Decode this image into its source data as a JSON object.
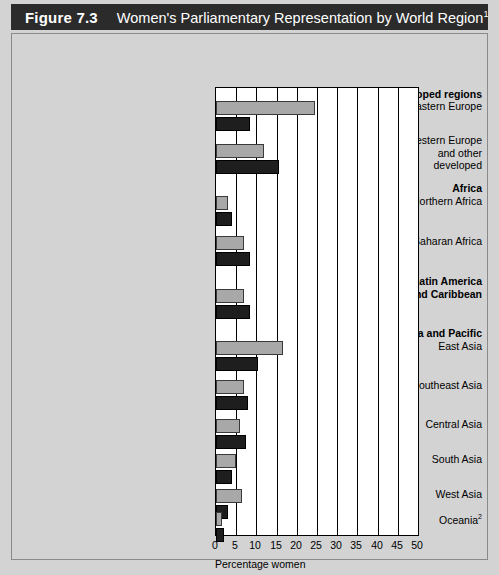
{
  "figure": {
    "number": "Figure 7.3",
    "title": "Women's Parliamentary Representation by World Region",
    "title_superscript": "1"
  },
  "legend": {
    "position": "bottom-left",
    "items": [
      {
        "label": "1987",
        "color": "#a8a8a8",
        "swatch": "legend-swatch-1987"
      },
      {
        "label": "1994",
        "color": "#1e1e1e",
        "swatch": "legend-swatch-1994"
      }
    ]
  },
  "axis": {
    "xlabel": "Percentage women",
    "ticks": [
      "0",
      "5",
      "10",
      "15",
      "20",
      "25",
      "30",
      "35",
      "40",
      "45",
      "50"
    ]
  },
  "rows": [
    {
      "kind": "group",
      "label": "Developed regions"
    },
    {
      "kind": "category",
      "label": "Eastern Europe",
      "v1987": 24.5,
      "v1994": 8.5
    },
    {
      "kind": "category",
      "label": "Western Europe\nand other\ndeveloped",
      "v1987": 12.0,
      "v1994": 15.5
    },
    {
      "kind": "group",
      "label": "Africa"
    },
    {
      "kind": "category",
      "label": "Northern Africa",
      "v1987": 3.0,
      "v1994": 4.0
    },
    {
      "kind": "category",
      "label": "Sub-Saharan Africa",
      "v1987": 7.0,
      "v1994": 8.5
    },
    {
      "kind": "group",
      "label": "Latin America\nand Caribbean"
    },
    {
      "kind": "category",
      "label": "",
      "v1987": 7.0,
      "v1994": 8.5
    },
    {
      "kind": "group",
      "label": "Asia and Pacific"
    },
    {
      "kind": "category",
      "label": "East Asia",
      "v1987": 16.5,
      "v1994": 10.5
    },
    {
      "kind": "category",
      "label": "Southeast Asia",
      "v1987": 7.0,
      "v1994": 8.0
    },
    {
      "kind": "category",
      "label": "Central Asia",
      "v1987": 6.0,
      "v1994": 7.5
    },
    {
      "kind": "category",
      "label": "South Asia",
      "v1987": 5.0,
      "v1994": 4.0
    },
    {
      "kind": "category",
      "label": "West Asia",
      "v1987": 6.5,
      "v1994": 3.0
    },
    {
      "kind": "category",
      "label": "Oceania",
      "label_superscript": "2",
      "v1987": 1.5,
      "v1994": 2.0
    }
  ],
  "chart_data": {
    "type": "bar",
    "orientation": "horizontal",
    "title": "Women's Parliamentary Representation by World Region",
    "xlabel": "Percentage women",
    "ylabel": "",
    "xlim": [
      0,
      50
    ],
    "xticks": [
      0,
      5,
      10,
      15,
      20,
      25,
      30,
      35,
      40,
      45,
      50
    ],
    "grid": true,
    "legend_position": "bottom-left",
    "categories": [
      "Eastern Europe",
      "Western Europe and other developed",
      "Northern Africa",
      "Sub-Saharan Africa",
      "Latin America and Caribbean",
      "East Asia",
      "Southeast Asia",
      "Central Asia",
      "South Asia",
      "West Asia",
      "Oceania"
    ],
    "group_headings": [
      {
        "label": "Developed regions",
        "categories": [
          "Eastern Europe",
          "Western Europe and other developed"
        ]
      },
      {
        "label": "Africa",
        "categories": [
          "Northern Africa",
          "Sub-Saharan Africa"
        ]
      },
      {
        "label": "Latin America and Caribbean",
        "categories": [
          "Latin America and Caribbean"
        ]
      },
      {
        "label": "Asia and Pacific",
        "categories": [
          "East Asia",
          "Southeast Asia",
          "Central Asia",
          "South Asia",
          "West Asia",
          "Oceania"
        ]
      }
    ],
    "series": [
      {
        "name": "1987",
        "color": "#a8a8a8",
        "values": [
          24.5,
          12.0,
          3.0,
          7.0,
          7.0,
          16.5,
          7.0,
          6.0,
          5.0,
          6.5,
          1.5
        ]
      },
      {
        "name": "1994",
        "color": "#1e1e1e",
        "values": [
          8.5,
          15.5,
          4.0,
          8.5,
          8.5,
          10.5,
          8.0,
          7.5,
          4.0,
          3.0,
          2.0
        ]
      }
    ]
  },
  "geometry": {
    "plot_left": 203,
    "plot_top": 53,
    "plot_width": 202,
    "plot_height": 447,
    "px_per_unit": 4.04,
    "bar_height": 14,
    "rows_layout": [
      {
        "type": "group",
        "label_top": 1,
        "label_key": "Developed regions"
      },
      {
        "type": "bars",
        "bar1_top": 13,
        "bar2_top": 29,
        "label_top": 13
      },
      {
        "type": "bars",
        "bar1_top": 56,
        "bar2_top": 72,
        "label_top": 47
      },
      {
        "type": "group",
        "label_top": 95
      },
      {
        "type": "bars",
        "bar1_top": 108,
        "bar2_top": 124,
        "label_top": 108
      },
      {
        "type": "bars",
        "bar1_top": 148,
        "bar2_top": 164,
        "label_top": 148
      },
      {
        "type": "group",
        "label_top": 188
      },
      {
        "type": "bars",
        "bar1_top": 201,
        "bar2_top": 217
      },
      {
        "type": "group",
        "label_top": 240
      },
      {
        "type": "bars",
        "bar1_top": 253,
        "bar2_top": 269,
        "label_top": 253
      },
      {
        "type": "bars",
        "bar1_top": 292,
        "bar2_top": 308,
        "label_top": 292
      },
      {
        "type": "bars",
        "bar1_top": 331,
        "bar2_top": 347,
        "label_top": 331
      },
      {
        "type": "bars",
        "bar1_top": 366,
        "bar2_top": 382,
        "label_top": 366
      },
      {
        "type": "bars",
        "bar1_top": 401,
        "bar2_top": 417,
        "label_top": 401
      },
      {
        "type": "bars",
        "bar1_top": 424,
        "bar2_top": 440,
        "label_top": 424
      }
    ]
  }
}
